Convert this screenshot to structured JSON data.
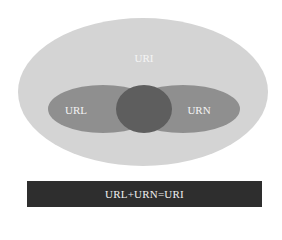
{
  "diagram": {
    "outer": {
      "label": "URI",
      "color": "#d4d4d4"
    },
    "left": {
      "label": "URL",
      "color": "#8f8f8f"
    },
    "right": {
      "label": "URN",
      "color": "#8f8f8f"
    },
    "intersection": {
      "color": "#5e5e5e"
    }
  },
  "caption": {
    "text": "URL+URN=URI",
    "background": "#2e2e2e"
  }
}
